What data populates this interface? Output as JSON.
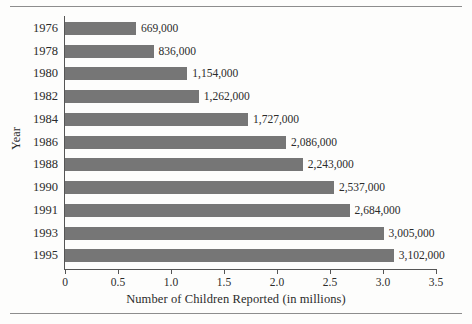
{
  "chart_data": {
    "type": "bar",
    "orientation": "horizontal",
    "title": "",
    "xlabel": "Number of Children Reported (in millions)",
    "ylabel": "Year",
    "categories": [
      "1976",
      "1978",
      "1980",
      "1982",
      "1984",
      "1986",
      "1988",
      "1990",
      "1991",
      "1993",
      "1995"
    ],
    "values": [
      0.669,
      0.836,
      1.154,
      1.262,
      1.727,
      2.086,
      2.243,
      2.537,
      2.684,
      3.005,
      3.102
    ],
    "value_labels": [
      "669,000",
      "836,000",
      "1,154,000",
      "1,262,000",
      "1,727,000",
      "2,086,000",
      "2,243,000",
      "2,537,000",
      "2,684,000",
      "3,005,000",
      "3,102,000"
    ],
    "xlim": [
      0,
      3.5
    ],
    "xticks": [
      0,
      0.5,
      1.0,
      1.5,
      2.0,
      2.5,
      3.0,
      3.5
    ],
    "xtick_labels": [
      "0",
      "0.5",
      "1.0",
      "1.5",
      "2.0",
      "2.5",
      "3.0",
      "3.5"
    ],
    "grid": false,
    "legend": null,
    "bar_color": "#767676",
    "axis_color": "#555555"
  }
}
